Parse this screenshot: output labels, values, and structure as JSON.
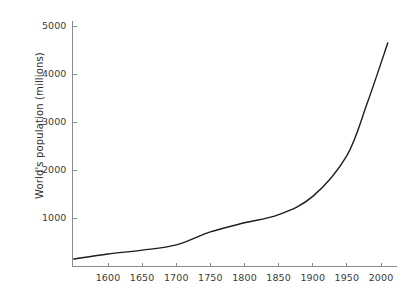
{
  "chart_data": {
    "type": "line",
    "title": "",
    "xlabel": "",
    "ylabel": "World's population (millions)",
    "xlim": [
      1550,
      2015
    ],
    "ylim": [
      0,
      5300
    ],
    "grid": false,
    "legend": false,
    "xticks": [
      1600,
      1650,
      1700,
      1750,
      1800,
      1850,
      1900,
      1950,
      2000
    ],
    "xtick_labels": [
      "1600",
      "1650",
      "1700",
      "1750",
      "1800",
      "1850",
      "1900",
      "1950",
      "2000"
    ],
    "yticks": [
      1000,
      2000,
      3000,
      4000,
      5000
    ],
    "ytick_labels": [
      "1000",
      "2000",
      "3000",
      "4000",
      "5000"
    ],
    "series": [
      {
        "name": "World's population",
        "color": "#1d1d1d",
        "x": [
          1550,
          1600,
          1650,
          1700,
          1750,
          1800,
          1850,
          1900,
          1950,
          1980,
          2010
        ],
        "y": [
          145,
          250,
          330,
          440,
          710,
          900,
          1070,
          1450,
          2300,
          3400,
          4650
        ]
      }
    ]
  },
  "axes": {
    "y_axis_color": "#8a8a8a",
    "x_axis_color": "#8a8a8a",
    "tick_text_color": "#3b3b3b",
    "label_text_color": "#2e2e2e"
  },
  "figure": {
    "background": "#ffffff",
    "width": 416,
    "height": 296
  }
}
